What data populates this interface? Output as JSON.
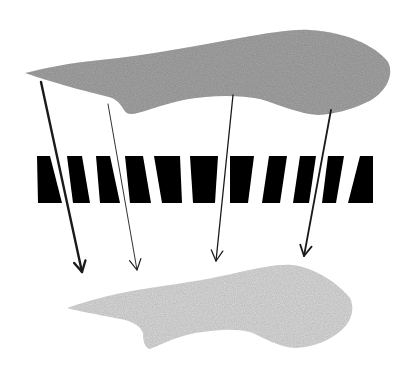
{
  "diagram": {
    "colors": {
      "background": "#ffffff",
      "source_shape": "#a6a6a6",
      "projected_shape": "#dcdcdc",
      "grating": "#000000",
      "arrow": "#1a1a1a"
    },
    "source_shape": {
      "path": "M25,73 C45,68 70,63 100,60 C150,55 200,45 240,38 C270,33 290,29 310,30 C345,32 375,45 388,62 C395,75 385,95 365,103 C350,110 335,114 318,115 C300,114 280,105 260,99 C245,96 225,95 205,97 C180,99 160,106 145,111 C135,114 127,116 124,110 C120,103 116,98 105,96 C80,90 45,80 25,73 Z"
    },
    "grating": {
      "top_y": 156,
      "bottom_y": 203,
      "bars": [
        {
          "tl": 37,
          "tr": 50,
          "bl": 38,
          "br": 62
        },
        {
          "tl": 67,
          "tr": 82,
          "bl": 73,
          "br": 90
        },
        {
          "tl": 96,
          "tr": 110,
          "bl": 100,
          "br": 120
        },
        {
          "tl": 125,
          "tr": 143,
          "bl": 130,
          "br": 151
        },
        {
          "tl": 154,
          "tr": 180,
          "bl": 162,
          "br": 182
        },
        {
          "tl": 190,
          "tr": 218,
          "bl": 193,
          "br": 215
        },
        {
          "tl": 230,
          "tr": 254,
          "bl": 230,
          "br": 248
        },
        {
          "tl": 269,
          "tr": 287,
          "bl": 262,
          "br": 280
        },
        {
          "tl": 300,
          "tr": 316,
          "bl": 293,
          "br": 309
        },
        {
          "tl": 328,
          "tr": 344,
          "bl": 322,
          "br": 336
        },
        {
          "tl": 360,
          "tr": 373,
          "bl": 348,
          "br": 373
        }
      ]
    },
    "arrows": [
      {
        "x1": 41,
        "y1": 82,
        "x2": 82,
        "y2": 272,
        "width": 2.4
      },
      {
        "x1": 108,
        "y1": 104,
        "x2": 137,
        "y2": 270,
        "width": 0.9
      },
      {
        "x1": 233,
        "y1": 95,
        "x2": 216,
        "y2": 261,
        "width": 1.3
      },
      {
        "x1": 331,
        "y1": 110,
        "x2": 304,
        "y2": 256,
        "width": 1.8
      }
    ],
    "projected_shape": {
      "path": "M67,308 C90,300 120,292 150,288 C185,283 215,278 240,272 C260,268 278,264 292,265 C315,267 340,285 350,298 C356,310 350,325 338,333 C325,343 310,347 295,348 C278,347 265,338 250,332 C235,328 215,330 195,333 C175,337 160,345 150,349 C145,348 143,342 143,333 C140,325 130,320 115,318 C95,314 78,311 67,308 Z"
    }
  }
}
